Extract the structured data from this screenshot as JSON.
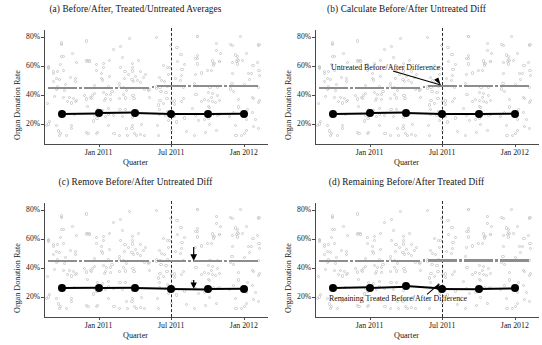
{
  "figure": {
    "panels": [
      {
        "key": "a",
        "title": "(a) Before/After, Treated/Untreated Averages",
        "xlabel": "Quarter",
        "ylabel": "Organ Donation Rate",
        "annotation": null
      },
      {
        "key": "b",
        "title": "(b) Calculate Before/After Untreated Diff",
        "xlabel": "Quarter",
        "ylabel": "Organ Donation Rate",
        "annotation": "Untreated Before/After Difference"
      },
      {
        "key": "c",
        "title": "(c) Remove Before/After Untreated Diff",
        "xlabel": "Quarter",
        "ylabel": "Organ Donation Rate",
        "annotation": null
      },
      {
        "key": "d",
        "title": "(d) Remaining Before/After Treated Diff",
        "xlabel": "Quarter",
        "ylabel": "Organ Donation Rate",
        "annotation": "Remaining Treated Before/After Difference"
      }
    ],
    "colors": {
      "untreated_line": "#8d8d8d",
      "treated_line": "#000000",
      "scatter": "#c9c9c9",
      "axis": "#4a4a4a",
      "cutoff_line": "#2a2a2a"
    }
  },
  "chart_data": {
    "type": "scatter",
    "xlabel": "Quarter",
    "ylabel": "Organ Donation Rate",
    "xlim": [
      0,
      6
    ],
    "ylim": [
      0.1,
      0.85
    ],
    "ytick_labels": [
      "20%",
      "40%",
      "60%",
      "80%"
    ],
    "ytick_values": [
      0.2,
      0.4,
      0.6,
      0.8
    ],
    "xtick_labels": [
      "Jan 2011",
      "Jul 2011",
      "Jan 2012"
    ],
    "xtick_values": [
      1.5,
      3.5,
      5.5
    ],
    "grid": false,
    "legend": "none",
    "cutoff_x": 3.5,
    "cutoff_style": "dashed vertical line at Jul 2011 (policy start)",
    "quarter_x": [
      0.5,
      1.5,
      2.5,
      3.5,
      4.5,
      5.5
    ],
    "panels": [
      {
        "key": "a",
        "title": "(a) Before/After, Treated/Untreated Averages",
        "series": [
          {
            "name": "Untreated average",
            "style": "gray dashed segments",
            "values": [
              0.446,
              0.446,
              0.446,
              0.462,
              0.462,
              0.462
            ]
          },
          {
            "name": "Treated average",
            "style": "black line with markers",
            "values": [
              0.268,
              0.272,
              0.275,
              0.268,
              0.268,
              0.27
            ]
          }
        ]
      },
      {
        "key": "b",
        "title": "(b) Calculate Before/After Untreated Diff",
        "annotation": "Untreated Before/After Difference",
        "series": [
          {
            "name": "Untreated average",
            "style": "gray dashed segments",
            "values": [
              0.446,
              0.446,
              0.446,
              0.462,
              0.462,
              0.462
            ]
          },
          {
            "name": "Treated average",
            "style": "black line with markers",
            "values": [
              0.268,
              0.272,
              0.275,
              0.268,
              0.268,
              0.27
            ]
          }
        ]
      },
      {
        "key": "c",
        "title": "(c) Remove Before/After Untreated Diff",
        "series": [
          {
            "name": "Untreated average (shifted down)",
            "style": "gray dashed segments",
            "values": [
              0.446,
              0.446,
              0.446,
              0.446,
              0.446,
              0.446
            ]
          },
          {
            "name": "Treated average (shifted down)",
            "style": "black line with markers",
            "values": [
              0.258,
              0.26,
              0.262,
              0.256,
              0.253,
              0.255
            ]
          }
        ]
      },
      {
        "key": "d",
        "title": "(d) Remaining Before/After Treated Diff",
        "annotation": "Remaining Treated Before/After Difference",
        "series": [
          {
            "name": "Untreated average",
            "style": "gray dashed segments",
            "values": [
              0.446,
              0.446,
              0.446,
              0.452,
              0.452,
              0.452
            ]
          },
          {
            "name": "Treated average",
            "style": "black line with step at cutoff",
            "values": [
              0.258,
              0.263,
              0.272,
              0.254,
              0.253,
              0.257
            ]
          }
        ]
      }
    ],
    "scatter_note": "Light gray open circles: individual state-quarter organ donation rates, range roughly 12% to 80%"
  }
}
